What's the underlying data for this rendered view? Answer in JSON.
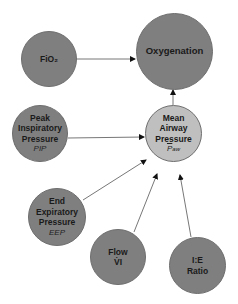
{
  "caption": "",
  "nodes": {
    "fio2": {
      "label": "FiO₂"
    },
    "oxygenation": {
      "label": "Oxygenation"
    },
    "pip": {
      "lines": [
        "Peak",
        "Inspiratory",
        "Pressure"
      ],
      "symbol": "PIP"
    },
    "maw": {
      "lines": [
        "Mean",
        "Airway",
        "Pressure"
      ],
      "symbol_main": "P",
      "symbol_sub": "aw"
    },
    "eep": {
      "lines": [
        "End",
        "Expiratory",
        "Pressure"
      ],
      "symbol": "EEP"
    },
    "flow": {
      "lines": [
        "Flow"
      ],
      "symbol": "V̇I"
    },
    "ie": {
      "lines": [
        "I:E",
        "Ratio"
      ]
    }
  },
  "colors": {
    "dark_node": "#7f7f7f",
    "light_node": "#bfbfbf",
    "arrow": "#555555"
  },
  "edges": [
    {
      "from": "FiO2",
      "to": "Oxygenation"
    },
    {
      "from": "Mean Airway Pressure",
      "to": "Oxygenation"
    },
    {
      "from": "Peak Inspiratory Pressure",
      "to": "Mean Airway Pressure"
    },
    {
      "from": "End Expiratory Pressure",
      "to": "Mean Airway Pressure"
    },
    {
      "from": "Flow",
      "to": "Mean Airway Pressure"
    },
    {
      "from": "I:E Ratio",
      "to": "Mean Airway Pressure"
    }
  ]
}
